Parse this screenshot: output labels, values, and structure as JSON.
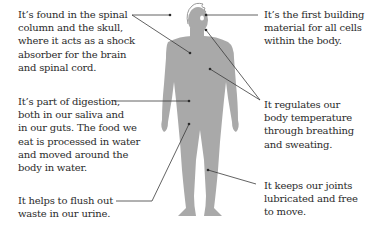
{
  "diagram": {
    "type": "annotated-illustration",
    "colors": {
      "silhouette": "#a9a9a9",
      "outline": "#9a9a9a",
      "leader_line": "#3a3a3a",
      "text": "#2b2b2b",
      "background": "#ffffff"
    },
    "annotations": {
      "spinal": {
        "text": "It’s found in the spinal\ncolumn and the skull,\nwhere it acts as a shock\nabsorber for the brain\nand spinal cord."
      },
      "digestion": {
        "text": "It’s part of digestion,\nboth in our saliva and\nin our guts. The food we\neat is processed in water\nand moved around the\nbody in water."
      },
      "urine": {
        "text": "It helps to flush out\nwaste in our urine."
      },
      "cells": {
        "text": "It’s the first building\nmaterial for all cells\nwithin the body."
      },
      "temperature": {
        "text": "It regulates our\nbody temperature\nthrough breathing\nand sweating."
      },
      "joints": {
        "text": "It keeps our joints\nlubricated and free\nto move."
      }
    }
  }
}
